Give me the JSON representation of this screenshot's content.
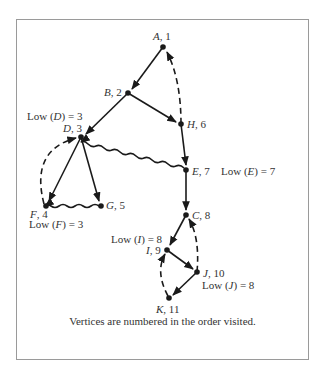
{
  "nodes": [
    {
      "id": "A",
      "label": "A, 1",
      "x": 163,
      "y": 47
    },
    {
      "id": "B",
      "label": "B, 2",
      "x": 128,
      "y": 93
    },
    {
      "id": "D",
      "label": "D, 3",
      "x": 81,
      "y": 137
    },
    {
      "id": "F",
      "label": "F, 4",
      "x": 46,
      "y": 206
    },
    {
      "id": "G",
      "label": "G, 5",
      "x": 101,
      "y": 206
    },
    {
      "id": "H",
      "label": "H, 6",
      "x": 181,
      "y": 124
    },
    {
      "id": "E",
      "label": "E, 7",
      "x": 186,
      "y": 170
    },
    {
      "id": "C",
      "label": "C, 8",
      "x": 186,
      "y": 215
    },
    {
      "id": "I",
      "label": "I, 9",
      "x": 167,
      "y": 250
    },
    {
      "id": "J",
      "label": "J, 10",
      "x": 197,
      "y": 272
    },
    {
      "id": "K",
      "label": "K, 11",
      "x": 169,
      "y": 298
    }
  ],
  "low_labels": {
    "D": "Low (D) = 3",
    "E": "Low (E) = 7",
    "F": "Low (F) = 3",
    "I": "Low (I) = 8",
    "J": "Low (J) = 8"
  },
  "edges": {
    "tree": [
      [
        "A",
        "B"
      ],
      [
        "B",
        "D"
      ],
      [
        "B",
        "H"
      ],
      [
        "D",
        "F"
      ],
      [
        "D",
        "G"
      ],
      [
        "H",
        "E"
      ],
      [
        "E",
        "C"
      ],
      [
        "C",
        "I"
      ],
      [
        "I",
        "J"
      ],
      [
        "J",
        "K"
      ]
    ],
    "back": [
      [
        "H",
        "A"
      ],
      [
        "F",
        "D"
      ],
      [
        "J",
        "C"
      ],
      [
        "K",
        "I"
      ]
    ],
    "cross": [
      [
        "E",
        "D"
      ],
      [
        "G",
        "F"
      ]
    ]
  },
  "legend": {
    "tree_edge": "solid arrow",
    "back_edge": "dashed arrow",
    "cross_edge": "wavy arrow"
  },
  "caption": "Vertices are numbered  in the order visited.",
  "colors": {
    "ink": "#1a1a1a",
    "frame": "#9a9a9a",
    "background": "#ffffff"
  }
}
